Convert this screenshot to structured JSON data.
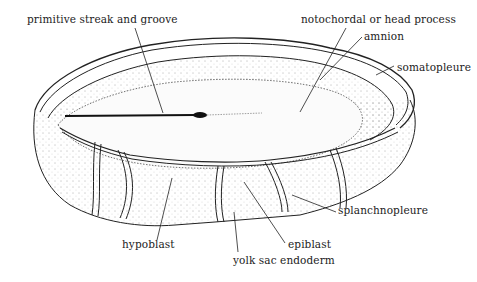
{
  "diagram": {
    "labels": [
      {
        "id": "primitive-streak",
        "text": "primitive streak and groove",
        "x": 27,
        "y": 13
      },
      {
        "id": "notochordal-process",
        "text": "notochordal or head process",
        "x": 301,
        "y": 13
      },
      {
        "id": "amnion",
        "text": "amnion",
        "x": 364,
        "y": 30
      },
      {
        "id": "somatopleure",
        "text": "somatopleure",
        "x": 397,
        "y": 61
      },
      {
        "id": "splanchnopleure",
        "text": "splanchnopleure",
        "x": 338,
        "y": 204
      },
      {
        "id": "hypoblast",
        "text": "hypoblast",
        "x": 122,
        "y": 238
      },
      {
        "id": "epiblast",
        "text": "epiblast",
        "x": 288,
        "y": 238
      },
      {
        "id": "yolk-sac-endoderm",
        "text": "yolk sac endoderm",
        "x": 233,
        "y": 254
      }
    ]
  }
}
